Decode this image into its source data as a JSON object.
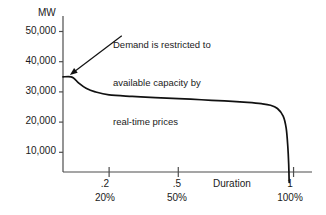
{
  "chart_data": {
    "type": "line",
    "title": "",
    "subtitle": "",
    "xlabel": "Duration",
    "ylabel": "MW",
    "ylim": [
      0,
      55000
    ],
    "xlim": [
      0,
      1.08
    ],
    "grid": false,
    "legend": null,
    "y_ticks": [
      {
        "value": 50000,
        "label": "50,000"
      },
      {
        "value": 40000,
        "label": "40,000"
      },
      {
        "value": 30000,
        "label": "30,000"
      },
      {
        "value": 20000,
        "label": "20,000"
      },
      {
        "value": 10000,
        "label": "10,000"
      }
    ],
    "x_ticks": [
      {
        "value": 0.2,
        "label": ".2",
        "label2": "20%"
      },
      {
        "value": 0.5,
        "label": ".5",
        "label2": "50%"
      },
      {
        "value": 1.0,
        "label": "1",
        "label2": "100%"
      }
    ],
    "series": [
      {
        "name": "Load duration curve",
        "points": [
          {
            "x": 0.0,
            "y": 35000
          },
          {
            "x": 0.035,
            "y": 35000
          },
          {
            "x": 0.05,
            "y": 34300
          },
          {
            "x": 0.07,
            "y": 32800
          },
          {
            "x": 0.1,
            "y": 31200
          },
          {
            "x": 0.14,
            "y": 30000
          },
          {
            "x": 0.2,
            "y": 29000
          },
          {
            "x": 0.3,
            "y": 28500
          },
          {
            "x": 0.4,
            "y": 28100
          },
          {
            "x": 0.5,
            "y": 27800
          },
          {
            "x": 0.6,
            "y": 27400
          },
          {
            "x": 0.7,
            "y": 27000
          },
          {
            "x": 0.8,
            "y": 26500
          },
          {
            "x": 0.86,
            "y": 26100
          },
          {
            "x": 0.9,
            "y": 25600
          },
          {
            "x": 0.93,
            "y": 24500
          },
          {
            "x": 0.955,
            "y": 22000
          },
          {
            "x": 0.968,
            "y": 18000
          },
          {
            "x": 0.975,
            "y": 12000
          },
          {
            "x": 0.979,
            "y": 6000
          },
          {
            "x": 0.981,
            "y": 0
          }
        ]
      }
    ],
    "annotations": [
      {
        "name": "capacity-restriction-note",
        "lines": [
          "Demand is restricted to",
          "available capacity by",
          "real-time prices"
        ],
        "arrow": {
          "from_x": 0.255,
          "from_y": 48600,
          "to_x": 0.03,
          "to_y": 35600
        }
      }
    ],
    "colors": {
      "curve": "#111111",
      "axis": "#4d4d4d",
      "text": "#1a1a1a",
      "background": "#ffffff"
    }
  }
}
